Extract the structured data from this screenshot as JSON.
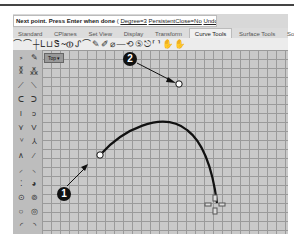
{
  "command_line": {
    "prompt": "Next point. Press Enter when done",
    "options_open": "(",
    "options": [
      {
        "label": "Degree=3"
      },
      {
        "label": "PersistentClose=No"
      },
      {
        "label": "Undo"
      }
    ],
    "options_close": ")"
  },
  "tabs": [
    {
      "label": "Standard",
      "active": false
    },
    {
      "label": "CPlanes",
      "active": false
    },
    {
      "label": "Set View",
      "active": false
    },
    {
      "label": "Display",
      "active": false
    },
    {
      "label": "Transform",
      "active": false
    },
    {
      "label": "Curve Tools",
      "active": true
    },
    {
      "label": "Surface Tools",
      "active": false
    },
    {
      "label": "Solid",
      "active": false
    }
  ],
  "toolbar": {
    "icons": [
      "curve-tool-icons"
    ],
    "glyphs": "⌒⌒┼ᒪ⊔Ꮥ∼⦶ᔑ⌒✎✐⌀—⟲⑤⎋⸢⸣✋✋"
  },
  "viewport": {
    "title": "Top",
    "dropdown_glyph": "▾"
  },
  "callouts": [
    {
      "number": "1",
      "target": "curve start point"
    },
    {
      "number": "2",
      "target": "next point"
    }
  ],
  "colors": {
    "grid_bg": "#c9c9c9",
    "grid_line": "#9a9a9a",
    "curve": "#111111",
    "callout_bg": "#111111"
  }
}
